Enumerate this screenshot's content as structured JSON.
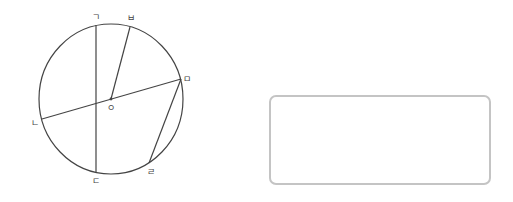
{
  "diagram": {
    "stroke_color": "#444444",
    "circle": {
      "cx": 111,
      "cy": 99,
      "rx": 72,
      "ry": 75
    },
    "center": {
      "x": 111,
      "y": 99,
      "label": "ㅇ",
      "label_x": 111,
      "label_y": 111
    },
    "points": [
      {
        "id": "g",
        "label": "ㄱ",
        "x": 96,
        "y": 25,
        "label_x": 96,
        "label_y": 20
      },
      {
        "id": "n",
        "label": "ㄴ",
        "x": 42,
        "y": 119,
        "label_x": 35,
        "label_y": 126
      },
      {
        "id": "d",
        "label": "ㄷ",
        "x": 96,
        "y": 172,
        "label_x": 96,
        "label_y": 184
      },
      {
        "id": "r",
        "label": "ㄹ",
        "x": 149,
        "y": 163,
        "label_x": 151,
        "label_y": 175
      },
      {
        "id": "m",
        "label": "ㅁ",
        "x": 181,
        "y": 79,
        "label_x": 187,
        "label_y": 82
      },
      {
        "id": "b",
        "label": "ㅂ",
        "x": 130,
        "y": 27,
        "label_x": 131,
        "label_y": 21
      }
    ],
    "segments": [
      {
        "from": "g",
        "to": "d",
        "name": "chord-g-d"
      },
      {
        "from": "n",
        "to": "m",
        "name": "diameter-n-m"
      },
      {
        "from": "m",
        "to": "r",
        "name": "chord-m-r"
      },
      {
        "from": "center",
        "to": "b",
        "name": "radius-o-b"
      }
    ]
  },
  "answer_box": {
    "border_color": "#c4c4c4"
  }
}
